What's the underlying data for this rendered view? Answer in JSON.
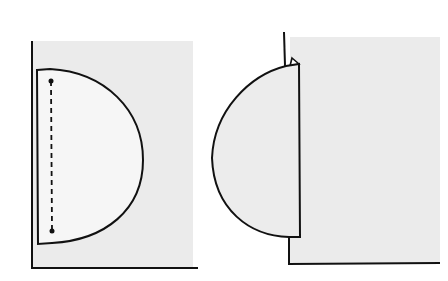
{
  "figure": {
    "colors": {
      "background": "#ffffff",
      "sheet": "#ebebeb",
      "flap": "#f6f6f6",
      "flap_folded": "#ececec",
      "line": "#111111"
    },
    "panels": [
      {
        "name": "before-fold",
        "fold_line": "dashed"
      },
      {
        "name": "after-fold"
      }
    ]
  }
}
